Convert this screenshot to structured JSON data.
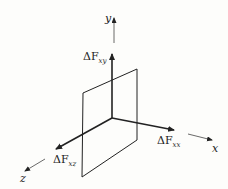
{
  "diagram": {
    "axes": {
      "x": {
        "label": "x"
      },
      "y": {
        "label": "y"
      },
      "z": {
        "label": "z"
      }
    },
    "vectors": [
      {
        "name": "dFxy",
        "symbol": "ΔF",
        "sub": "xy",
        "direction": "y"
      },
      {
        "name": "dFxx",
        "symbol": "ΔF",
        "sub": "xx",
        "direction": "x"
      },
      {
        "name": "dFxz",
        "symbol": "ΔF",
        "sub": "xz",
        "direction": "z"
      }
    ],
    "colors": {
      "ink": "#222222",
      "background": "#fdfdfb"
    }
  }
}
